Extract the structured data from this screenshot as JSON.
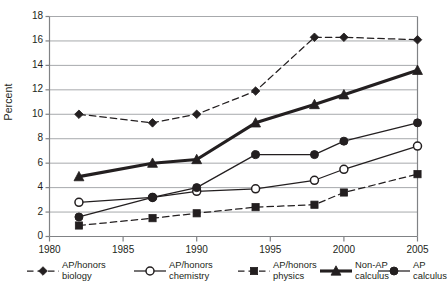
{
  "chart_data": {
    "type": "line",
    "title": "",
    "xlabel": "",
    "ylabel": "Percent",
    "xlim": [
      1980,
      2005
    ],
    "ylim": [
      0,
      18
    ],
    "ytick_step": 2,
    "xticks": [
      1980,
      1985,
      1990,
      1995,
      2000,
      2005
    ],
    "yticks": [
      0,
      2,
      4,
      6,
      8,
      10,
      12,
      14,
      16,
      18
    ],
    "grid": "horizontal",
    "legend_position": "below",
    "x": [
      1982,
      1987,
      1990,
      1994,
      1998,
      2000,
      2005
    ],
    "series": [
      {
        "name": "AP/honors biology",
        "marker": "diamond-filled",
        "line": "dashed",
        "weight": "thin",
        "values": [
          10.0,
          9.3,
          10.0,
          11.9,
          16.3,
          16.3,
          16.1
        ]
      },
      {
        "name": "AP/honors chemistry",
        "marker": "circle-open",
        "line": "solid",
        "weight": "thin",
        "values": [
          2.8,
          3.2,
          3.7,
          3.9,
          4.6,
          5.5,
          7.4
        ]
      },
      {
        "name": "AP/honors physics",
        "marker": "square-filled",
        "line": "dashed",
        "weight": "thin",
        "values": [
          0.9,
          1.5,
          1.9,
          2.4,
          2.6,
          3.6,
          5.1
        ]
      },
      {
        "name": "Non-AP calculus",
        "marker": "triangle-filled",
        "line": "solid",
        "weight": "thick",
        "values": [
          4.9,
          6.0,
          6.3,
          9.3,
          10.8,
          11.6,
          13.6
        ]
      },
      {
        "name": "AP calculus",
        "marker": "circle-filled",
        "line": "solid",
        "weight": "thin",
        "values": [
          1.6,
          3.2,
          4.0,
          6.7,
          6.7,
          7.8,
          9.3
        ]
      }
    ]
  },
  "axis": {
    "ylabel": "Percent",
    "ytick_labels": [
      "18",
      "16",
      "14",
      "12",
      "10",
      "8",
      "6",
      "4",
      "2",
      "0"
    ],
    "xtick_labels": [
      "1980",
      "1985",
      "1990",
      "1995",
      "2000",
      "2005"
    ]
  },
  "legend": {
    "items": [
      {
        "line1": "AP/honors",
        "line2": "biology"
      },
      {
        "line1": "AP/honors",
        "line2": "chemistry"
      },
      {
        "line1": "AP/honors",
        "line2": "physics"
      },
      {
        "line1": "Non-AP",
        "line2": "calculus"
      },
      {
        "line1": "AP",
        "line2": "calculus"
      }
    ]
  },
  "colors": {
    "ink": "#231f20",
    "grid": "#a7a9ac",
    "axis": "#808285",
    "background": "#ffffff"
  }
}
